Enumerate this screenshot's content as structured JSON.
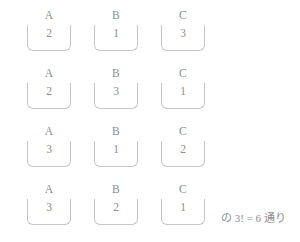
{
  "page": {
    "background_color": "#ffffff",
    "ink_color": "#8e8e8e",
    "bracket_color": "#c6c6c6"
  },
  "diagram": {
    "column_labels": [
      "A",
      "B",
      "C"
    ],
    "column_x": [
      27,
      94,
      161
    ],
    "row_y": [
      8,
      66,
      124,
      182
    ],
    "rows": [
      {
        "values": [
          "2",
          "1",
          "3"
        ]
      },
      {
        "values": [
          "2",
          "3",
          "1"
        ]
      },
      {
        "values": [
          "3",
          "1",
          "2"
        ]
      },
      {
        "values": [
          "3",
          "2",
          "1"
        ]
      }
    ]
  },
  "annotation": {
    "text": "の 3! = 6 通り"
  }
}
